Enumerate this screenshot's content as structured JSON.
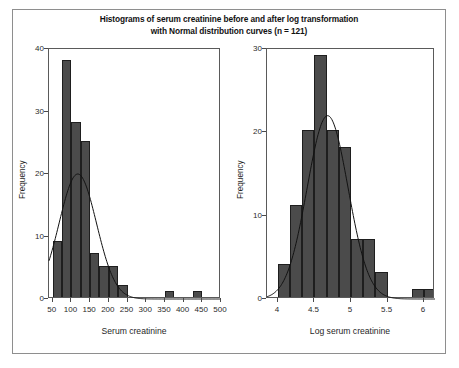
{
  "figure": {
    "title_line1": "Histograms of serum creatinine before and after log transformation",
    "title_line2": "with Normal distribution curves (n = 121)",
    "bar_color": "#4b4b4b",
    "bar_edge_color": "#1e1e1e",
    "curve_color": "#121212",
    "frame_color": "#5a5a5a",
    "outer_border_color": "#8e8e8e",
    "background": "#ffffff"
  },
  "chart_data": [
    {
      "type": "bar",
      "id": "serum-creatinine-histogram",
      "title": "Histograms of serum creatinine before and after log transformation with Normal distribution curves (n = 121)",
      "xlabel": "Serum creatinine",
      "ylabel": "Frequency",
      "xlim": [
        40,
        500
      ],
      "ylim": [
        0,
        40
      ],
      "xticks": [
        50,
        100,
        150,
        200,
        250,
        300,
        350,
        400,
        450,
        500
      ],
      "xticklabels": [
        "50",
        "100",
        "150",
        "200",
        "250",
        "300",
        "350",
        "400",
        "450",
        "500"
      ],
      "yticks": [
        0,
        10,
        20,
        30,
        40
      ],
      "yticklabels": [
        "0",
        "10",
        "20",
        "30",
        "40"
      ],
      "grid": false,
      "legend": "none",
      "bin_width": 25,
      "bins": [
        {
          "left": 50,
          "right": 75,
          "value": 9
        },
        {
          "left": 75,
          "right": 100,
          "value": 38
        },
        {
          "left": 100,
          "right": 125,
          "value": 28
        },
        {
          "left": 125,
          "right": 150,
          "value": 25
        },
        {
          "left": 150,
          "right": 175,
          "value": 7
        },
        {
          "left": 175,
          "right": 200,
          "value": 5
        },
        {
          "left": 200,
          "right": 225,
          "value": 5
        },
        {
          "left": 225,
          "right": 250,
          "value": 2
        },
        {
          "left": 350,
          "right": 375,
          "value": 1
        },
        {
          "left": 425,
          "right": 450,
          "value": 1
        }
      ],
      "overlay_curve": {
        "name": "Normal distribution curve",
        "mean": 117,
        "sd": 50,
        "peak_value": 20,
        "peak_x": 117
      }
    },
    {
      "type": "bar",
      "id": "log-serum-creatinine-histogram",
      "title": "Histograms of serum creatinine before and after log transformation with Normal distribution curves (n = 121)",
      "xlabel": "Log serum creatinine",
      "ylabel": "Frequency",
      "xlim": [
        3.85,
        6.15
      ],
      "ylim": [
        0,
        30
      ],
      "xticks": [
        4,
        4.5,
        5,
        5.5,
        6
      ],
      "xticklabels": [
        "4",
        "4.5",
        "5",
        "5.5",
        "6"
      ],
      "yticks": [
        0,
        10,
        20,
        30
      ],
      "yticklabels": [
        "0",
        "10",
        "20",
        "30"
      ],
      "grid": false,
      "legend": "none",
      "bin_width": 0.167,
      "bins": [
        {
          "left": 4.0,
          "right": 4.167,
          "value": 4
        },
        {
          "left": 4.167,
          "right": 4.333,
          "value": 11
        },
        {
          "left": 4.333,
          "right": 4.5,
          "value": 20
        },
        {
          "left": 4.5,
          "right": 4.667,
          "value": 29
        },
        {
          "left": 4.667,
          "right": 4.833,
          "value": 20
        },
        {
          "left": 4.833,
          "right": 5.0,
          "value": 18
        },
        {
          "left": 5.0,
          "right": 5.167,
          "value": 7
        },
        {
          "left": 5.167,
          "right": 5.333,
          "value": 7
        },
        {
          "left": 5.333,
          "right": 5.5,
          "value": 3
        },
        {
          "left": 5.833,
          "right": 6.0,
          "value": 1
        },
        {
          "left": 6.0,
          "right": 6.167,
          "value": 1
        }
      ],
      "overlay_curve": {
        "name": "Normal distribution curve",
        "mean": 4.68,
        "sd": 0.28,
        "peak_value": 22,
        "peak_x": 4.68
      }
    }
  ]
}
